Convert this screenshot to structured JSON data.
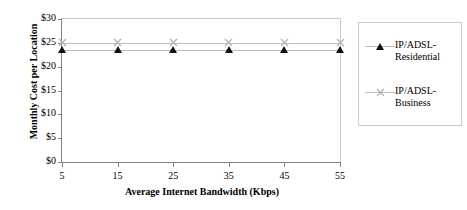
{
  "chart_data": {
    "type": "line",
    "title": "",
    "xlabel": "Average Internet Bandwidth (Kbps)",
    "ylabel": "Monthly Cost per Location",
    "x": [
      5,
      15,
      25,
      35,
      45,
      55
    ],
    "xticklabels": [
      "5",
      "15",
      "25",
      "35",
      "45",
      "55"
    ],
    "xlim": [
      5,
      55
    ],
    "yticks": [
      0,
      5,
      10,
      15,
      20,
      25,
      30
    ],
    "yticklabels": [
      "$0",
      "$5",
      "$10",
      "$15",
      "$20",
      "$25",
      "$30"
    ],
    "ylim": [
      0,
      30
    ],
    "grid": false,
    "legend_position": "right",
    "series": [
      {
        "name": "IP/ADSL-Residential",
        "marker": "triangle",
        "marker_color": "#111111",
        "line_color": "#bdbdbd",
        "values": [
          23.5,
          23.5,
          23.5,
          23.5,
          23.5,
          23.5
        ]
      },
      {
        "name": "IP/ADSL-Business",
        "marker": "cross",
        "marker_color": "#b0b0b0",
        "line_color": "#bdbdbd",
        "values": [
          25,
          25,
          25,
          25,
          25,
          25
        ]
      }
    ]
  },
  "legend": {
    "entries": [
      {
        "label": "IP/ADSL-Residential"
      },
      {
        "label": "IP/ADSL-Business"
      }
    ]
  }
}
